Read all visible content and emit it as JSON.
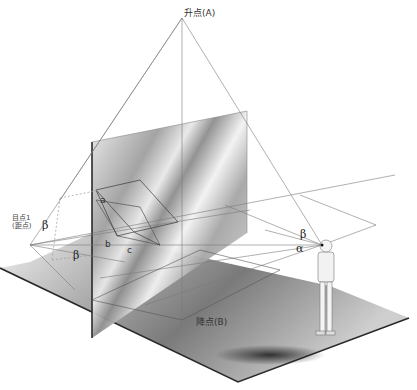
{
  "diagram": {
    "type": "perspective-construction",
    "labels": {
      "rising_point": "升点(A)",
      "falling_point": "降点(B)",
      "eye_point_line1": "目点1",
      "eye_point_line2": "(距点)",
      "edge_a": "a",
      "edge_b": "b",
      "edge_c": "c",
      "angle_beta_left": "β",
      "angle_beta_lower": "β",
      "angle_beta_observer": "β",
      "angle_alpha_observer": "α"
    },
    "elements": [
      {
        "name": "ground-plane",
        "description": "dark gradient floor parallelogram"
      },
      {
        "name": "picture-plane",
        "description": "vertical grey reflective panel"
      },
      {
        "name": "inclined-box",
        "description": "wireframe tilted rectangle with edges a, b, c"
      },
      {
        "name": "observer",
        "description": "standing figure at right, eye point"
      },
      {
        "name": "sight-pyramid",
        "description": "lines converging to 升点(A) at top"
      },
      {
        "name": "horizon-lines",
        "description": "lines from observer to 目点1 (距点)"
      }
    ],
    "colors": {
      "line": "#6e6e6e",
      "dark_line": "#2a2a2a",
      "floor_dark": "#3a3a3a",
      "floor_light": "#d8d8d8",
      "panel": "#b5b5b5"
    }
  }
}
